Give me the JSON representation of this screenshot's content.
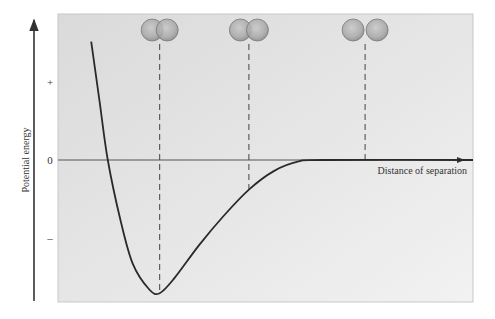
{
  "chart_data": {
    "type": "line",
    "title": "",
    "xlabel": "Distance of separation",
    "ylabel": "Potential energy",
    "y_tick_labels": [
      "+",
      "0",
      "–"
    ],
    "series": [
      {
        "name": "potential energy",
        "points": [
          [
            0.08,
            1.6
          ],
          [
            0.1,
            0.8
          ],
          [
            0.12,
            0.0
          ],
          [
            0.15,
            -0.8
          ],
          [
            0.18,
            -1.4
          ],
          [
            0.22,
            -1.75
          ],
          [
            0.245,
            -1.8
          ],
          [
            0.28,
            -1.6
          ],
          [
            0.34,
            -1.15
          ],
          [
            0.4,
            -0.75
          ],
          [
            0.46,
            -0.4
          ],
          [
            0.52,
            -0.15
          ],
          [
            0.58,
            -0.02
          ],
          [
            0.64,
            0.0
          ],
          [
            1.0,
            0.0
          ]
        ]
      }
    ],
    "markers": [
      {
        "label": "overlapping atoms",
        "x": 0.245,
        "overlap": "high"
      },
      {
        "label": "touching atoms",
        "x": 0.46,
        "overlap": "low"
      },
      {
        "label": "separated atoms",
        "x": 0.74,
        "overlap": "none"
      }
    ],
    "xlim": [
      0,
      1
    ],
    "ylim": [
      -2,
      2
    ]
  },
  "colors": {
    "panel": "#e2e2e2",
    "curve": "#2a2a2a",
    "axis": "#333333",
    "atom": "#9a9a9a"
  }
}
